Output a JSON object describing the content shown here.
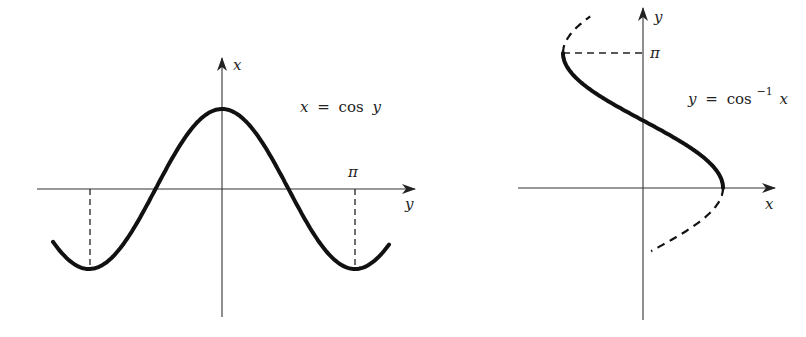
{
  "left_figure": {
    "equation": {
      "lhs": "x",
      "eq": "=",
      "func": "cos",
      "arg": "y"
    },
    "vertical_axis_label": "x",
    "horizontal_axis_label": "y",
    "tick_label": "π"
  },
  "right_figure": {
    "equation": {
      "lhs": "y",
      "eq": "=",
      "func": "cos",
      "sup": "−1",
      "arg": "x"
    },
    "vertical_axis_label": "y",
    "horizontal_axis_label": "x",
    "tick_label": "π"
  },
  "colors": {
    "curve": "#111111",
    "axis": "#333333",
    "text": "#222222"
  },
  "chart_data": [
    {
      "type": "line",
      "title": "x = cos y",
      "xlabel": "y",
      "ylabel": "x",
      "x": [
        -3.9,
        -3.1416,
        -1.5708,
        0,
        1.5708,
        3.1416,
        3.9
      ],
      "series": [
        {
          "name": "x = cos y",
          "values": [
            -0.73,
            -1,
            0,
            1,
            0,
            -1,
            -0.73
          ]
        }
      ],
      "annotations": [
        "π marked on y-axis",
        "dashed verticals at y = ±π"
      ],
      "grid": false
    },
    {
      "type": "line",
      "title": "y = cos⁻¹ x",
      "xlabel": "x",
      "ylabel": "y",
      "x": [
        -1,
        -0.5,
        0,
        0.5,
        1
      ],
      "series": [
        {
          "name": "y = cos⁻¹ x (principal branch, solid)",
          "values": [
            3.1416,
            2.0944,
            1.5708,
            1.0472,
            0
          ]
        },
        {
          "name": "continuation (dashed)",
          "values": []
        }
      ],
      "annotations": [
        "π marked on y-axis",
        "dashed horizontal at y = π"
      ],
      "grid": false
    }
  ]
}
